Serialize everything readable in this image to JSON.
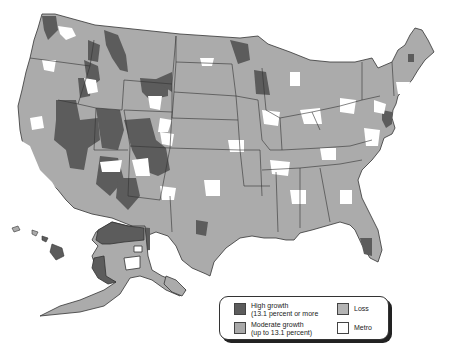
{
  "map": {
    "title": "",
    "subject": "U.S. county population change map",
    "colors": {
      "high_growth": "#5c5c5c",
      "moderate_growth": "#a9a9a9",
      "loss": "#b4b4b4",
      "metro": "#ffffff",
      "border": "#333333"
    }
  },
  "legend": {
    "items": [
      {
        "key": "high_growth",
        "line1": "High growth",
        "line2": "(13.1 percent or more",
        "color": "#5c5c5c"
      },
      {
        "key": "moderate_growth",
        "line1": "Moderate growth",
        "line2": "(up to 13.1 percent)",
        "color": "#a9a9a9"
      },
      {
        "key": "loss",
        "line1": "Loss",
        "line2": "",
        "color": "#b4b4b4"
      },
      {
        "key": "metro",
        "line1": "Metro",
        "line2": "",
        "color": "#ffffff"
      }
    ]
  }
}
